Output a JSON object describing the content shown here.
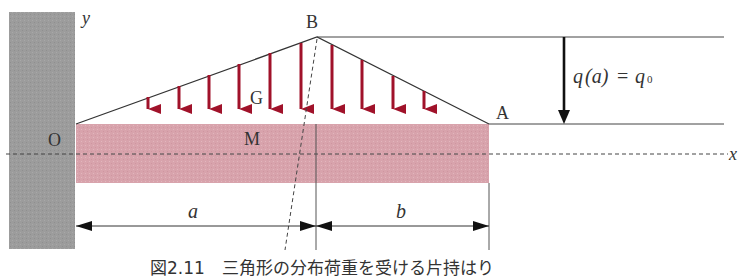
{
  "figure": {
    "caption": "図2.11　三角形の分布荷重を受ける片持はり",
    "caption_note": "Caption is clipped at the bottom edge of the image; this text is a best-effort reconstruction from partially visible glyphs, and the figure number may be inaccurate.",
    "labels": {
      "y_axis": "y",
      "x_axis": "x",
      "origin": "O",
      "apex": "B",
      "tip": "A",
      "centroid": "G",
      "point_m": "M",
      "dim_a": "a",
      "dim_b": "b",
      "load_label_q": "q",
      "load_label_arg": "(a)",
      "load_label_eq": "=",
      "load_label_q0": "q",
      "load_label_sub": "0"
    },
    "colors": {
      "wall": "#9a9a9a",
      "beam": "#d9a5ad",
      "load_arrow": "#a0122a",
      "line": "#333333"
    }
  }
}
